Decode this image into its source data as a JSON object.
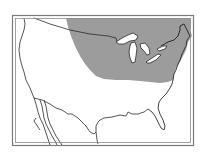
{
  "map": {
    "type": "range-map",
    "region": "United States and southern Canada",
    "shaded_region": "north-central and northeastern United States and adjacent southern Canada, around the Great Lakes",
    "colors": {
      "background": "#ffffff",
      "frame": "#7a7a7a",
      "outline": "#2a2a2a",
      "range_fill": "#9c9c9c",
      "lakes": "#ffffff"
    },
    "features": [
      "frame",
      "coastline",
      "us-canada-border",
      "us-mexico-border",
      "great-lakes",
      "baja-california",
      "florida",
      "range-area"
    ]
  }
}
